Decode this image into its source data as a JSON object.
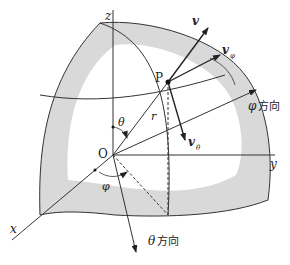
{
  "figure": {
    "type": "spherical-coordinates-diagram",
    "axes": {
      "x": "x",
      "y": "y",
      "z": "z"
    },
    "origin": "O",
    "point": "P",
    "radius": "r",
    "angles": {
      "polar": "θ",
      "azimuth": "φ"
    },
    "vectors": {
      "v": "v",
      "v_phi": {
        "base": "v",
        "sub": "φ"
      },
      "v_theta": {
        "base": "v",
        "sub": "θ"
      },
      "v_r": {
        "base": "v",
        "sub": "r"
      }
    },
    "directions": {
      "phi_dir": {
        "symbol": "φ",
        "text": "方向"
      },
      "theta_dir": {
        "symbol": "θ",
        "text": "方向"
      }
    },
    "colors": {
      "shell_fill": "#d9d9d9",
      "line": "#333333",
      "background": "#ffffff"
    }
  }
}
